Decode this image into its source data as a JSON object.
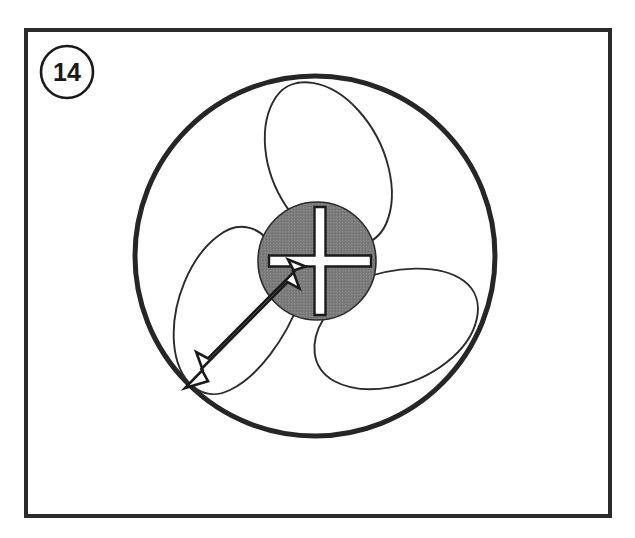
{
  "figure": {
    "kind": "technical-line-drawing",
    "caption_label": "14",
    "frame": {
      "x": 24,
      "y": 28,
      "width": 588,
      "height": 490,
      "stroke_color": "#2b2b2b",
      "stroke_width": 4,
      "fill_color": "#ffffff"
    },
    "label_badge": {
      "text": "14",
      "center_x": 67,
      "center_y": 72,
      "radius": 26,
      "stroke_color": "#1a1a1a",
      "stroke_width": 2.6,
      "fill_color": "#ffffff",
      "text_color": "#1a1a1a"
    },
    "outer_circle": {
      "name": "fan-shroud-outline",
      "center_x": 315,
      "center_y": 256,
      "radius": 180,
      "stroke_color": "#262626",
      "stroke_width": 5,
      "fill_color": "#ffffff"
    },
    "hub": {
      "name": "fan-hub",
      "center_x": 317,
      "center_y": 261,
      "radius": 59,
      "fill_color": "#7c7c7c",
      "stroke_color": "#2b2b2b",
      "stroke_width": 1.5
    },
    "center_mark": {
      "name": "center-cross-mark",
      "center_x": 320,
      "center_y": 261,
      "arm_length_horizontal": 51,
      "arm_length_vertical": 54,
      "bar_thickness": 11,
      "fill_color": "#ffffff",
      "stroke_color": "#1a1a1a",
      "stroke_width": 2.4
    },
    "blades": [
      {
        "name": "blade-upper",
        "index": 1,
        "angle_degrees": 95,
        "fill_color": "#ffffff",
        "stroke_color": "#2b2b2b",
        "stroke_width": 1.8
      },
      {
        "name": "blade-lower-right",
        "index": 2,
        "angle_degrees": 340,
        "fill_color": "#ffffff",
        "stroke_color": "#2b2b2b",
        "stroke_width": 1.8
      },
      {
        "name": "blade-lower-left",
        "index": 3,
        "angle_degrees": 215,
        "fill_color": "#ffffff",
        "stroke_color": "#2b2b2b",
        "stroke_width": 1.8
      }
    ],
    "dimension_arrow": {
      "name": "radius-dimension-arrow",
      "style": "double-headed-open-outline",
      "tail_x": 186,
      "tail_y": 388,
      "head_x": 305,
      "head_y": 268,
      "fill_color": "#ffffff",
      "stroke_color": "#1a1a1a",
      "stroke_width": 2.6
    },
    "colors": {
      "ink": "#1a1a1a",
      "frame_stroke": "#2b2b2b",
      "hub_gray": "#7c7c7c",
      "paper": "#ffffff"
    }
  }
}
